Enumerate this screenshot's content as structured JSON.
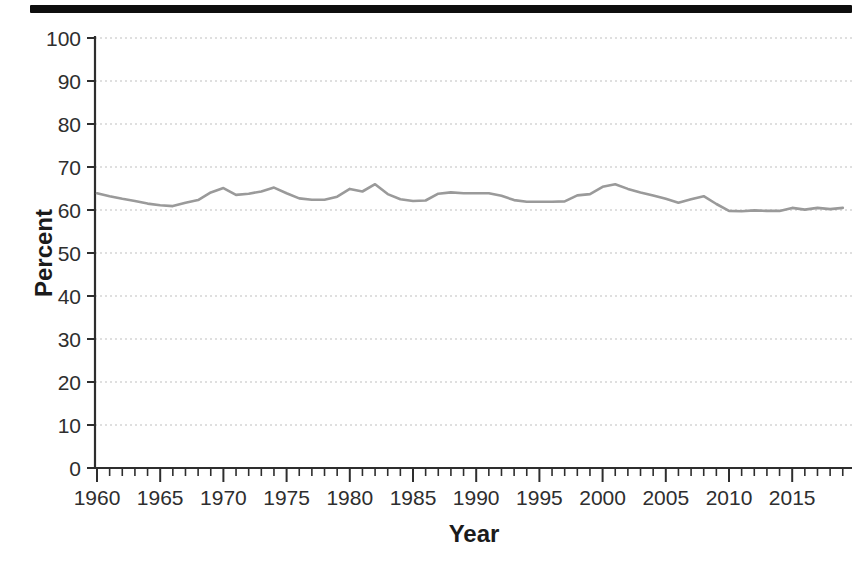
{
  "figure": {
    "background": "#ffffff",
    "scan_bar_color": "#0e0e0e"
  },
  "chart_data": {
    "type": "line",
    "title": "",
    "xlabel": "Year",
    "ylabel": "Percent",
    "xlim": [
      1960,
      2019.7
    ],
    "ylim": [
      0,
      100
    ],
    "grid": "horizontal-dashed",
    "legend": "none",
    "line_color": "#9a9a9a",
    "grid_color": "#bfbfbf",
    "axis_color": "#2e2e2e",
    "ytick_values": [
      0,
      10,
      20,
      30,
      40,
      50,
      60,
      70,
      80,
      90,
      100
    ],
    "ytick_labels": [
      "0",
      "10",
      "20",
      "30",
      "40",
      "50",
      "60",
      "70",
      "80",
      "90",
      "100"
    ],
    "xtick_major_values": [
      1960,
      1965,
      1970,
      1975,
      1980,
      1985,
      1990,
      1995,
      2000,
      2005,
      2010,
      2015
    ],
    "xtick_labels": [
      "1960",
      "1965",
      "1970",
      "1975",
      "1980",
      "1985",
      "1990",
      "1995",
      "2000",
      "2005",
      "2010",
      "2015"
    ],
    "xtick_minor_interval": 1,
    "x": [
      1960,
      1961,
      1962,
      1963,
      1964,
      1965,
      1966,
      1967,
      1968,
      1969,
      1970,
      1971,
      1972,
      1973,
      1974,
      1975,
      1976,
      1977,
      1978,
      1979,
      1980,
      1981,
      1982,
      1983,
      1984,
      1985,
      1986,
      1987,
      1988,
      1989,
      1990,
      1991,
      1992,
      1993,
      1994,
      1995,
      1996,
      1997,
      1998,
      1999,
      2000,
      2001,
      2002,
      2003,
      2004,
      2005,
      2006,
      2007,
      2008,
      2009,
      2010,
      2011,
      2012,
      2013,
      2014,
      2015,
      2016,
      2017,
      2018,
      2019
    ],
    "values": [
      63.9,
      63.2,
      62.6,
      62.1,
      61.5,
      61.1,
      60.9,
      61.7,
      62.3,
      64.1,
      65.1,
      63.5,
      63.8,
      64.3,
      65.2,
      63.9,
      62.7,
      62.4,
      62.4,
      63.1,
      64.9,
      64.3,
      66.0,
      63.7,
      62.5,
      62.1,
      62.2,
      63.8,
      64.1,
      63.9,
      63.9,
      63.9,
      63.3,
      62.3,
      61.9,
      61.9,
      61.9,
      62.0,
      63.4,
      63.7,
      65.4,
      66.0,
      64.9,
      64.1,
      63.4,
      62.6,
      61.7,
      62.5,
      63.2,
      61.4,
      59.8,
      59.7,
      59.9,
      59.8,
      59.8,
      60.5,
      60.1,
      60.5,
      60.2,
      60.5
    ]
  }
}
